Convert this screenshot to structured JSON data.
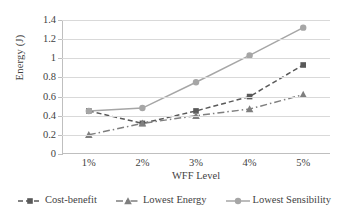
{
  "chart_data": {
    "type": "line",
    "title": "",
    "xlabel": "WFF Level",
    "ylabel": "Energy (J)",
    "categories": [
      "1%",
      "2%",
      "3%",
      "4%",
      "5%"
    ],
    "ylim": [
      0,
      1.4
    ],
    "yticks": [
      "0",
      "0.2",
      "0.4",
      "0.6",
      "0.8",
      "1",
      "1.2",
      "1.4"
    ],
    "ytick_values": [
      0,
      0.2,
      0.4,
      0.6,
      0.8,
      1,
      1.2,
      1.4
    ],
    "grid": true,
    "legend_position": "bottom",
    "series": [
      {
        "name": "Cost-benefit",
        "values": [
          0.45,
          0.32,
          0.45,
          0.6,
          0.93
        ],
        "marker": "square",
        "linestyle": "dashed",
        "color": "#595959"
      },
      {
        "name": "Lowest Energy",
        "values": [
          0.2,
          0.32,
          0.4,
          0.47,
          0.62
        ],
        "marker": "triangle",
        "linestyle": "dashdot",
        "color": "#7f7f7f"
      },
      {
        "name": "Lowest Sensibility",
        "values": [
          0.45,
          0.48,
          0.75,
          1.03,
          1.32
        ],
        "marker": "circle",
        "linestyle": "solid",
        "color": "#a6a6a6"
      }
    ]
  },
  "axes": {
    "y_title": "Energy (J)",
    "x_title": "WFF Level"
  },
  "legend": {
    "items": [
      {
        "label": "Cost-benefit"
      },
      {
        "label": "Lowest Energy"
      },
      {
        "label": "Lowest Sensibility"
      }
    ]
  }
}
